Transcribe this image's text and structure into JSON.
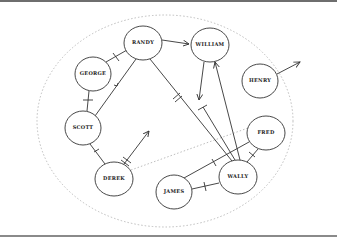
{
  "diagram": {
    "type": "sociogram",
    "boundary": {
      "style": "dotted-ellipse",
      "color": "#b0b0b0",
      "cx": 165,
      "cy": 121,
      "rx": 128,
      "ry": 106
    },
    "inner_link": {
      "style": "dotted",
      "from": "DEREK",
      "to": "FRED",
      "color": "#b0b0b0"
    },
    "nodes": [
      {
        "id": "RANDY",
        "label": "RANDY",
        "cx": 143,
        "cy": 43,
        "rx": 19,
        "ry": 17
      },
      {
        "id": "WILLIAM",
        "label": "WILLIAM",
        "cx": 210,
        "cy": 45,
        "rx": 19,
        "ry": 17
      },
      {
        "id": "GEORGE",
        "label": "GEORGE",
        "cx": 93,
        "cy": 74,
        "rx": 18,
        "ry": 17
      },
      {
        "id": "HENRY",
        "label": "HENRY",
        "cx": 260,
        "cy": 81,
        "rx": 18,
        "ry": 17
      },
      {
        "id": "SCOTT",
        "label": "SCOTT",
        "cx": 83,
        "cy": 128,
        "rx": 18,
        "ry": 17
      },
      {
        "id": "FRED",
        "label": "FRED",
        "cx": 266,
        "cy": 133,
        "rx": 19,
        "ry": 17
      },
      {
        "id": "DEREK",
        "label": "DEREK",
        "cx": 114,
        "cy": 179,
        "rx": 19,
        "ry": 17
      },
      {
        "id": "WALLY",
        "label": "WALLY",
        "cx": 238,
        "cy": 177,
        "rx": 19,
        "ry": 17
      },
      {
        "id": "JAMES",
        "label": "JAMES",
        "cx": 174,
        "cy": 192,
        "rx": 18,
        "ry": 17
      }
    ],
    "edges": [
      {
        "from": "RANDY",
        "to": "WILLIAM",
        "kind": "arrow"
      },
      {
        "from": "GEORGE",
        "to": "RANDY",
        "kind": "barred"
      },
      {
        "from": "GEORGE",
        "to": "SCOTT",
        "kind": "barred"
      },
      {
        "from": "SCOTT",
        "to": "RANDY",
        "kind": "arrow-mid"
      },
      {
        "from": "SCOTT",
        "to": "DEREK",
        "kind": "barred"
      },
      {
        "from": "DEREK",
        "to": "void",
        "kind": "double-barred-arrow"
      },
      {
        "from": "RANDY",
        "to": "WALLY",
        "kind": "double-barred"
      },
      {
        "from": "WILLIAM",
        "to": "void",
        "kind": "arrow-down"
      },
      {
        "from": "WALLY",
        "to": "void",
        "kind": "barred-end"
      },
      {
        "from": "WALLY",
        "to": "WILLIAM",
        "kind": "arrow"
      },
      {
        "from": "WALLY",
        "to": "FRED",
        "kind": "barred"
      },
      {
        "from": "JAMES",
        "to": "FRED",
        "kind": "barred"
      },
      {
        "from": "JAMES",
        "to": "WALLY",
        "kind": "barred"
      },
      {
        "from": "HENRY",
        "to": "outside",
        "kind": "arrow-out"
      }
    ]
  }
}
